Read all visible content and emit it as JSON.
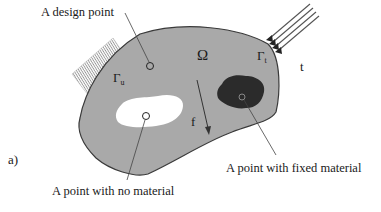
{
  "figure": {
    "panel_label": "a)",
    "domain_symbol": "Ω",
    "boundary_fixed": {
      "symbol": "Γ",
      "subscript": "u"
    },
    "boundary_traction": {
      "symbol": "Γ",
      "subscript": "t"
    },
    "traction_label": "t",
    "body_force_label": "f",
    "annotations": {
      "design_point": "A design point",
      "no_material": "A point with no material",
      "fixed_material": "A point with fixed material"
    },
    "colors": {
      "domain_fill": "#a9a9a9",
      "domain_stroke": "#3a3a3a",
      "void_fill": "#ffffff",
      "fixed_material_fill": "#2b2b2b",
      "text": "#1a1a1a",
      "hatch": "#8c8c8c"
    }
  }
}
